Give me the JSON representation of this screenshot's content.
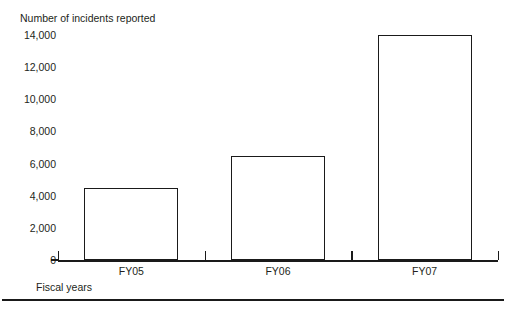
{
  "chart_data": {
    "type": "bar",
    "title": "",
    "ylabel": "Number of incidents reported",
    "xlabel": "Fiscal years",
    "categories": [
      "FY05",
      "FY06",
      "FY07"
    ],
    "values": [
      4500,
      6500,
      14000
    ],
    "ylim": [
      0,
      14000
    ],
    "yticks": [
      0,
      2000,
      4000,
      6000,
      8000,
      10000,
      12000,
      14000
    ],
    "ytick_labels": [
      "0",
      "2,000",
      "4,000",
      "6,000",
      "8,000",
      "10,000",
      "12,000",
      "14,000"
    ],
    "grid": false,
    "legend": null,
    "bar_style": {
      "fill": "#ffffff",
      "edge": "#1a1a1a"
    }
  },
  "figure": {
    "axis_color": "#1a1a1a",
    "text_color": "#231f20",
    "background": "#ffffff",
    "footer_rule": true
  }
}
